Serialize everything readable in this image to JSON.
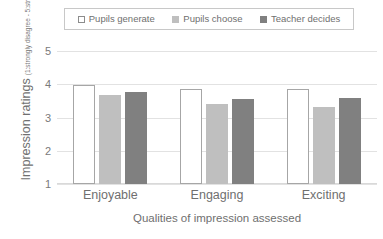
{
  "chart_data": {
    "type": "bar",
    "categories": [
      "Enjoyable",
      "Engaging",
      "Exciting"
    ],
    "series": [
      {
        "name": "Pupils generate",
        "values": [
          3.97,
          3.87,
          3.85
        ],
        "color": "#ffffff"
      },
      {
        "name": "Pupils choose",
        "values": [
          3.68,
          3.4,
          3.33
        ],
        "color": "#bfbfbf"
      },
      {
        "name": "Teacher decides",
        "values": [
          3.76,
          3.57,
          3.59
        ],
        "color": "#808080"
      }
    ],
    "title": "",
    "xlabel": "Qualities of impression assessed",
    "ylabel": "Impression ratings",
    "ylabel_sub": "(1:strongly disagree - 5:strongly agree)",
    "ylim": [
      1,
      5
    ],
    "yticks": [
      5,
      4,
      3,
      2,
      1
    ],
    "grid": true,
    "legend_position": "top"
  },
  "legend": {
    "items": [
      {
        "label": "Pupils generate"
      },
      {
        "label": "Pupils choose"
      },
      {
        "label": "Teacher decides"
      }
    ]
  },
  "axes": {
    "y_title": "Impression ratings",
    "y_subtitle": "(1:strongly disagree - 5:strongly agree)",
    "x_title": "Qualities of impression assessed",
    "y_ticks": [
      "5",
      "4",
      "3",
      "2",
      "1"
    ],
    "x_ticks": [
      "Enjoyable",
      "Engaging",
      "Exciting"
    ]
  }
}
